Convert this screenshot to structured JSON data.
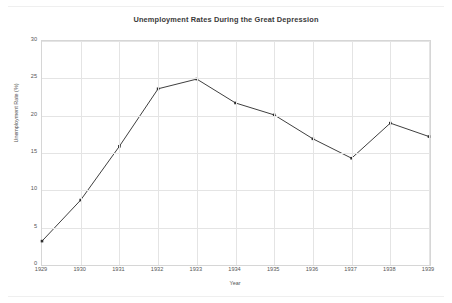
{
  "chart_data": {
    "type": "line",
    "title": "Unemployment Rates During the Great Depression",
    "xlabel": "Year",
    "ylabel": "Unemployment Rate (%)",
    "categories": [
      "1929",
      "1930",
      "1931",
      "1932",
      "1933",
      "1934",
      "1935",
      "1936",
      "1937",
      "1938",
      "1939"
    ],
    "values": [
      3.2,
      8.7,
      15.9,
      23.6,
      24.9,
      21.7,
      20.1,
      16.9,
      14.3,
      19.0,
      17.2
    ],
    "series": [
      {
        "name": "Unemployment Rate (%)",
        "values": [
          3.2,
          8.7,
          15.9,
          23.6,
          24.9,
          21.7,
          20.1,
          16.9,
          14.3,
          19.0,
          17.2
        ]
      }
    ],
    "ylim": [
      0,
      30
    ],
    "yticks": [
      0,
      5,
      10,
      15,
      20,
      25,
      30
    ],
    "ytick_labels": [
      "0",
      "5",
      "10",
      "15",
      "20",
      "25",
      "30"
    ],
    "xtick_labels": [
      "1929",
      "1930",
      "1931",
      "1932",
      "1933",
      "1934",
      "1935",
      "1936",
      "1937",
      "1938",
      "1939"
    ],
    "grid": true,
    "legend": false,
    "marker": "square",
    "line_color": "#3f3f3f",
    "marker_color": "#2e2e2e",
    "grid_color": "#e4e4e4",
    "axis_color": "#d6d6d6",
    "background_color": "#ffffff"
  }
}
